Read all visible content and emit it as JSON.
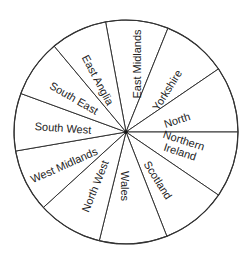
{
  "chart_data": {
    "type": "pie",
    "title": "",
    "center": [
      126,
      132
    ],
    "radius": 112,
    "start_angle_deg": 349.5,
    "direction": "clockwise",
    "categories": [
      "East Midlands",
      "Yorkshire",
      "North",
      "Northern Ireland",
      "Scotland",
      "Wales",
      "North West",
      "West Midlands",
      "South West",
      "South East",
      "East Anglia"
    ],
    "values": [
      32.5,
      33.7,
      34.3,
      34.3,
      34.3,
      35.2,
      33.8,
      32.6,
      29.9,
      30.0,
      29.4
    ],
    "units": "degrees (approx. equal slices, ~1/11 each)",
    "labels": [
      {
        "text": [
          "East Midlands"
        ],
        "x": 137,
        "y": 64,
        "rot": -90
      },
      {
        "text": [
          "Yorkshire"
        ],
        "x": 167,
        "y": 90,
        "rot": -58
      },
      {
        "text": [
          "North"
        ],
        "x": 177,
        "y": 120,
        "rot": -18
      },
      {
        "text": [
          "Northern",
          "Ireland"
        ],
        "x": 182,
        "y": 146,
        "rot": 18
      },
      {
        "text": [
          "Scotland"
        ],
        "x": 158,
        "y": 180,
        "rot": 58
      },
      {
        "text": [
          "Wales"
        ],
        "x": 125,
        "y": 186,
        "rot": 90
      },
      {
        "text": [
          "North West"
        ],
        "x": 95,
        "y": 186,
        "rot": -68
      },
      {
        "text": [
          "West Midlands"
        ],
        "x": 64,
        "y": 165,
        "rot": -24
      },
      {
        "text": [
          "South West"
        ],
        "x": 63,
        "y": 128,
        "rot": 4
      },
      {
        "text": [
          "South East"
        ],
        "x": 74,
        "y": 98,
        "rot": 30
      },
      {
        "text": [
          "East Anglia"
        ],
        "x": 98,
        "y": 80,
        "rot": 62
      }
    ],
    "legend": null,
    "colors": {
      "fill": "#ffffff",
      "stroke": "#333333",
      "text": "#222222"
    }
  }
}
